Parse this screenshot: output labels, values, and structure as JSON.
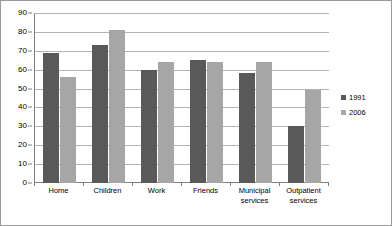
{
  "chart_data": {
    "type": "bar",
    "title": "",
    "subtitle": "",
    "xlabel": "",
    "ylabel": "",
    "ylim": [
      0,
      90
    ],
    "ytick_step": 10,
    "yticks": [
      0,
      10,
      20,
      30,
      40,
      50,
      60,
      70,
      80,
      90
    ],
    "grid": true,
    "legend_position": "right",
    "categories": [
      "Home",
      "Children",
      "Work",
      "Friends",
      "Municipal services",
      "Outpatient services"
    ],
    "series": [
      {
        "name": "1991",
        "color": "#595959",
        "values": [
          69,
          73,
          60,
          65,
          58,
          30
        ]
      },
      {
        "name": "2006",
        "color": "#a6a6a6",
        "values": [
          56,
          81,
          64,
          64,
          64,
          49
        ]
      }
    ]
  },
  "legend": {
    "items": [
      {
        "label": "1991",
        "color": "#595959"
      },
      {
        "label": "2006",
        "color": "#a6a6a6"
      }
    ]
  },
  "colors": {
    "series_1991": "#595959",
    "series_2006": "#a6a6a6",
    "gridline": "#b3b3b3",
    "axis": "#808080",
    "border": "#9a9a9a",
    "background": "#ffffff"
  }
}
